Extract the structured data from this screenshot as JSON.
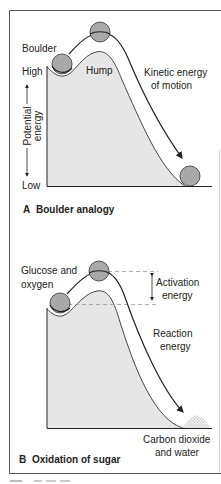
{
  "figure": {
    "panel_a": {
      "title_letter": "A",
      "title_text": "Boulder analogy",
      "labels": {
        "boulder": "Boulder",
        "high": "High",
        "hump": "Hump",
        "kinetic_line1": "Kinetic energy",
        "kinetic_line2": "of motion",
        "axis_line1": "Potential",
        "axis_line2": "energy",
        "low": "Low"
      }
    },
    "panel_b": {
      "title_letter": "B",
      "title_text": "Oxidation of sugar",
      "labels": {
        "reactants_line1": "Glucose and",
        "reactants_line2": "oxygen",
        "activation_line1": "Activation",
        "activation_line2": "energy",
        "reaction_line1": "Reaction",
        "reaction_line2": "energy",
        "products_line1": "Carbon dioxide",
        "products_line2": "and water"
      }
    },
    "colors": {
      "fill_gray": "#e6e6e6",
      "boulder_gray": "#a9a9a9",
      "line": "#222222",
      "border": "#555555",
      "dash": "#999999"
    }
  }
}
